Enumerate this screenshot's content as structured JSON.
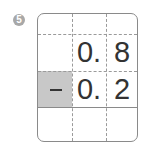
{
  "problem": {
    "number_badge": "5",
    "rows": [
      {
        "op": "",
        "ones": "0.",
        "tenths": "8"
      },
      {
        "op": "−",
        "ones": "0.",
        "tenths": "2"
      },
      {
        "op": "",
        "ones": "",
        "tenths": ""
      }
    ],
    "colors": {
      "border": "#8a8a8a",
      "shade": "#c8c8c8",
      "text": "#333333",
      "badge": "#a8a8a8"
    }
  }
}
